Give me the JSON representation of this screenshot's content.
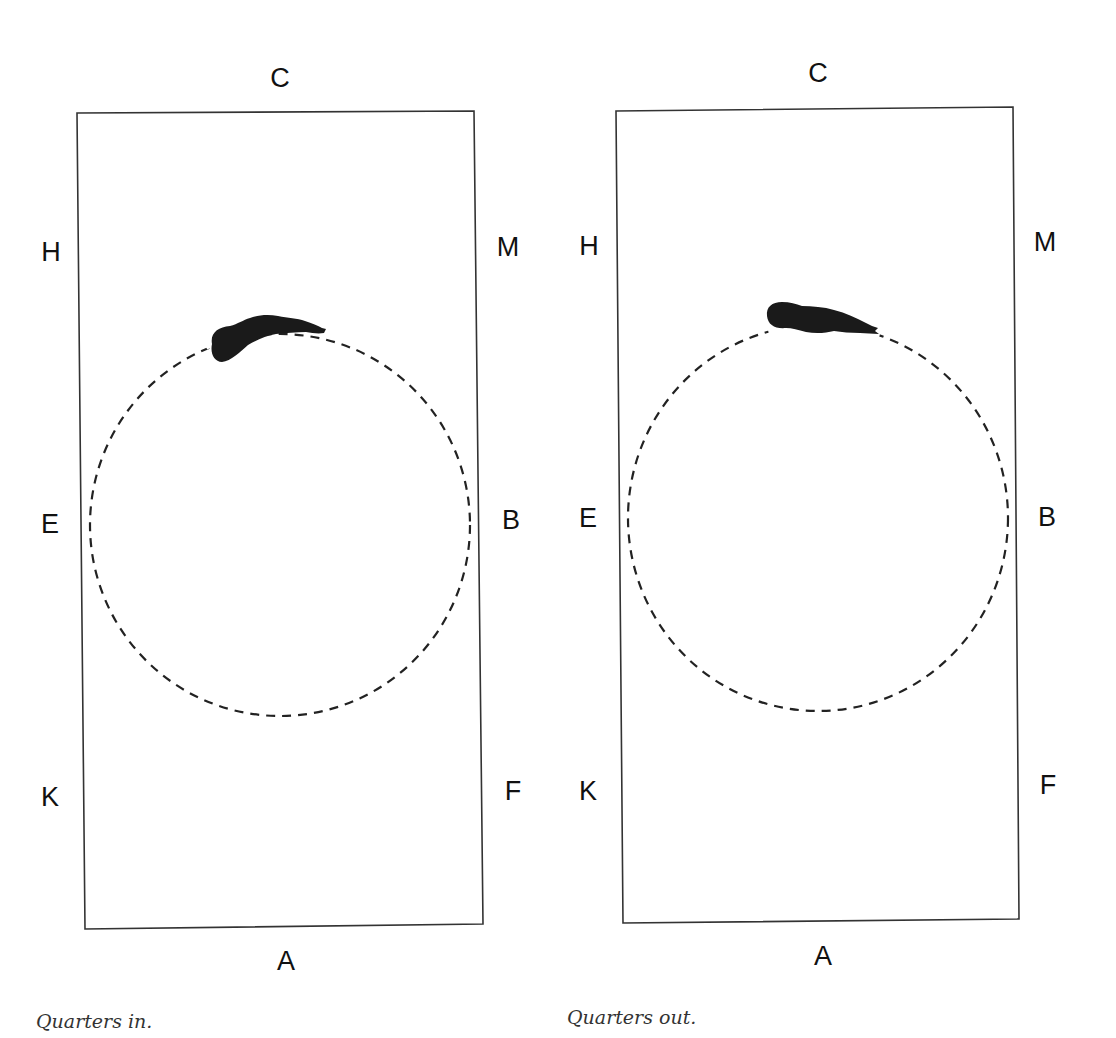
{
  "colors": {
    "line": "#333333",
    "dashed_path": "#222222",
    "horse": "#1a1a1a",
    "text": "#111111",
    "caption": "#333333"
  },
  "diagrams": [
    {
      "name": "quarters-in",
      "caption": "Quarters in.",
      "letters": {
        "top": "C",
        "bottom": "A",
        "left_upper": "H",
        "left_middle": "E",
        "left_lower": "K",
        "right_upper": "M",
        "right_middle": "B",
        "right_lower": "F"
      },
      "path_shape": "circle",
      "path_style": "dashed",
      "horse_icon": "horse-top-view-icon",
      "horse_position": "top of circle, head pointing right, hindquarters to the inside"
    },
    {
      "name": "quarters-out",
      "caption": "Quarters out.",
      "letters": {
        "top": "C",
        "bottom": "A",
        "left_upper": "H",
        "left_middle": "E",
        "left_lower": "K",
        "right_upper": "M",
        "right_middle": "B",
        "right_lower": "F"
      },
      "path_shape": "circle",
      "path_style": "dashed",
      "horse_icon": "horse-top-view-icon",
      "horse_position": "top of circle, head pointing right, hindquarters to the outside"
    }
  ]
}
